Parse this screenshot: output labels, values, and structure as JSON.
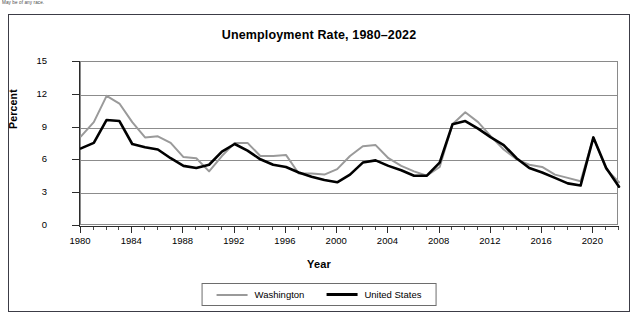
{
  "footnote": "May be of any race.",
  "figure": {
    "title": "Unemployment Rate, 1980–2022"
  },
  "axes": {
    "y_title": "Percent",
    "x_title": "Year",
    "y_ticks": [
      "0",
      "3",
      "6",
      "9",
      "12",
      "15"
    ],
    "x_ticks": [
      "1980",
      "1984",
      "1988",
      "1992",
      "1996",
      "2000",
      "2004",
      "2008",
      "2012",
      "2016",
      "2020"
    ]
  },
  "legend": {
    "items": [
      {
        "label": "Washington",
        "color": "#9a9a9a"
      },
      {
        "label": "United States",
        "color": "#000000"
      }
    ]
  },
  "chart_data": {
    "type": "line",
    "title": "Unemployment Rate, 1980–2022",
    "xlabel": "Year",
    "ylabel": "Percent",
    "xlim": [
      1980,
      2022
    ],
    "ylim": [
      0,
      15
    ],
    "ytick_interval": 3,
    "xtick_interval": 4,
    "minor_xtick_interval": 1,
    "grid": "horizontal",
    "legend_position": "bottom-center",
    "x": [
      1980,
      1981,
      1982,
      1983,
      1984,
      1985,
      1986,
      1987,
      1988,
      1989,
      1990,
      1991,
      1992,
      1993,
      1994,
      1995,
      1996,
      1997,
      1998,
      1999,
      2000,
      2001,
      2002,
      2003,
      2004,
      2005,
      2006,
      2007,
      2008,
      2009,
      2010,
      2011,
      2012,
      2013,
      2014,
      2015,
      2016,
      2017,
      2018,
      2019,
      2020,
      2021,
      2022
    ],
    "series": [
      {
        "name": "Washington",
        "color": "#9a9a9a",
        "values": [
          8.2,
          9.5,
          11.9,
          11.2,
          9.5,
          8.1,
          8.2,
          7.6,
          6.3,
          6.2,
          5.0,
          6.4,
          7.6,
          7.6,
          6.4,
          6.4,
          6.5,
          4.8,
          4.8,
          4.7,
          5.2,
          6.4,
          7.3,
          7.4,
          6.2,
          5.5,
          5.0,
          4.6,
          5.4,
          9.3,
          10.4,
          9.5,
          8.2,
          7.0,
          6.1,
          5.6,
          5.4,
          4.7,
          4.4,
          4.1,
          8.1,
          5.2,
          4.0
        ]
      },
      {
        "name": "United States",
        "color": "#000000",
        "values": [
          7.1,
          7.6,
          9.7,
          9.6,
          7.5,
          7.2,
          7.0,
          6.2,
          5.5,
          5.3,
          5.6,
          6.8,
          7.5,
          6.9,
          6.1,
          5.6,
          5.4,
          4.9,
          4.5,
          4.2,
          4.0,
          4.7,
          5.8,
          6.0,
          5.5,
          5.1,
          4.6,
          4.6,
          5.8,
          9.3,
          9.6,
          8.9,
          8.1,
          7.4,
          6.2,
          5.3,
          4.9,
          4.4,
          3.9,
          3.7,
          8.1,
          5.3,
          3.6
        ]
      }
    ]
  }
}
